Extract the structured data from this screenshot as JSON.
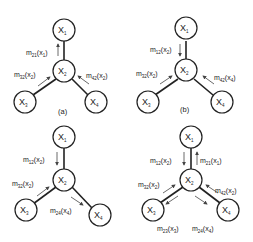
{
  "diagram": {
    "title": "",
    "panels": [
      {
        "id": "a",
        "caption": "(a)",
        "nodes": {
          "x1": {
            "label": "X",
            "sub": "1"
          },
          "x2": {
            "label": "X",
            "sub": "2"
          },
          "x3": {
            "label": "X",
            "sub": "3"
          },
          "x4": {
            "label": "X",
            "sub": "4"
          }
        },
        "messages": [
          {
            "m": "m",
            "msub": "21",
            "arg": "(x",
            "asub": "1",
            "close": ")",
            "from": "X2",
            "to": "X1"
          },
          {
            "m": "m",
            "msub": "32",
            "arg": "(x",
            "asub": "2",
            "close": ")",
            "from": "X3",
            "to": "X2"
          },
          {
            "m": "m",
            "msub": "42",
            "arg": "(x",
            "asub": "2",
            "close": ")",
            "from": "X4",
            "to": "X2"
          }
        ]
      },
      {
        "id": "b",
        "caption": "(b)",
        "nodes": {
          "x1": {
            "label": "X",
            "sub": "1"
          },
          "x2": {
            "label": "X",
            "sub": "2"
          },
          "x3": {
            "label": "X",
            "sub": "3"
          },
          "x4": {
            "label": "X",
            "sub": "4"
          }
        },
        "messages": [
          {
            "m": "m",
            "msub": "12",
            "arg": "(x",
            "asub": "2",
            "close": ")",
            "from": "X1",
            "to": "X2"
          },
          {
            "m": "m",
            "msub": "32",
            "arg": "(x",
            "asub": "2",
            "close": ")",
            "from": "X3",
            "to": "X2"
          },
          {
            "m": "m",
            "msub": "42",
            "arg": "(x",
            "asub": "4",
            "close": ")",
            "from": "X4",
            "to": "X2"
          }
        ]
      },
      {
        "id": "c",
        "caption": "",
        "nodes": {
          "x1": {
            "label": "X",
            "sub": "1"
          },
          "x2": {
            "label": "X",
            "sub": "2"
          },
          "x3": {
            "label": "X",
            "sub": "3"
          },
          "x4": {
            "label": "X",
            "sub": "4"
          }
        },
        "messages": [
          {
            "m": "m",
            "msub": "12",
            "arg": "(x",
            "asub": "2",
            "close": ")",
            "from": "X1",
            "to": "X2"
          },
          {
            "m": "m",
            "msub": "32",
            "arg": "(x",
            "asub": "2",
            "close": ")",
            "from": "X3",
            "to": "X2"
          },
          {
            "m": "m",
            "msub": "24",
            "arg": "(x",
            "asub": "4",
            "close": ")",
            "from": "X2",
            "to": "X4"
          }
        ]
      },
      {
        "id": "d",
        "caption": "",
        "nodes": {
          "x1": {
            "label": "X",
            "sub": "1"
          },
          "x2": {
            "label": "X",
            "sub": "2"
          },
          "x3": {
            "label": "X",
            "sub": "3"
          },
          "x4": {
            "label": "X",
            "sub": "4"
          }
        },
        "messages": [
          {
            "m": "m",
            "msub": "12",
            "arg": "(x",
            "asub": "2",
            "close": ")",
            "from": "X1",
            "to": "X2"
          },
          {
            "m": "m",
            "msub": "21",
            "arg": "(x",
            "asub": "1",
            "close": ")",
            "from": "X2",
            "to": "X1"
          },
          {
            "m": "m",
            "msub": "32",
            "arg": "(x",
            "asub": "2",
            "close": ")",
            "from": "X3",
            "to": "X2"
          },
          {
            "m": "m",
            "msub": "42",
            "arg": "(x",
            "asub": "2",
            "close": ")",
            "from": "X4",
            "to": "X2"
          },
          {
            "m": "m",
            "msub": "23",
            "arg": "(x",
            "asub": "3",
            "close": ")",
            "from": "X2",
            "to": "X3"
          },
          {
            "m": "m",
            "msub": "24",
            "arg": "(x",
            "asub": "4",
            "close": ")",
            "from": "X2",
            "to": "X4"
          }
        ]
      }
    ]
  }
}
